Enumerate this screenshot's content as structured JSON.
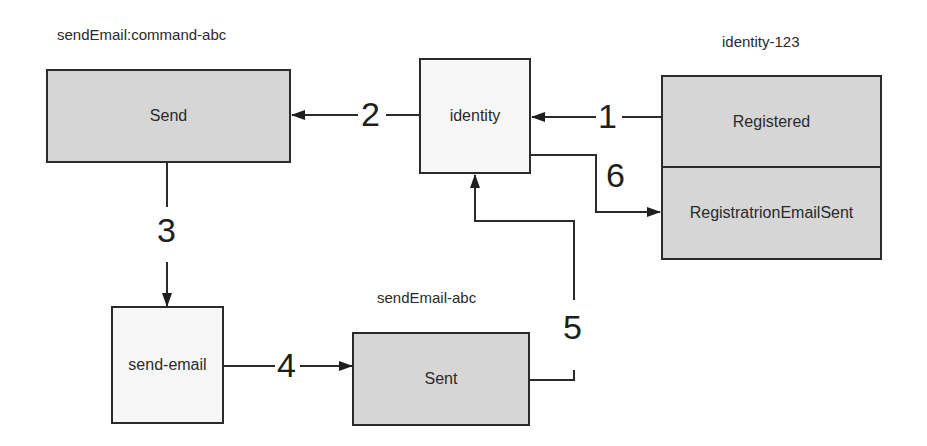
{
  "diagram": {
    "streams": {
      "send_command": {
        "caption": "sendEmail:command-abc",
        "events": [
          "Send"
        ]
      },
      "identity_stream": {
        "caption": "identity-123",
        "events": [
          "Registered",
          "RegistratrionEmailSent"
        ]
      },
      "send_email_stream": {
        "caption": "sendEmail-abc",
        "events": [
          "Sent"
        ]
      }
    },
    "components": {
      "identity": "identity",
      "send_email": "send-email"
    },
    "steps": [
      {
        "label": "1",
        "from": "Registered",
        "to": "identity"
      },
      {
        "label": "2",
        "from": "identity",
        "to": "Send"
      },
      {
        "label": "3",
        "from": "Send",
        "to": "send-email"
      },
      {
        "label": "4",
        "from": "send-email",
        "to": "Sent"
      },
      {
        "label": "5",
        "from": "Sent",
        "to": "identity"
      },
      {
        "label": "6",
        "from": "identity",
        "to": "RegistratrionEmailSent"
      }
    ]
  }
}
